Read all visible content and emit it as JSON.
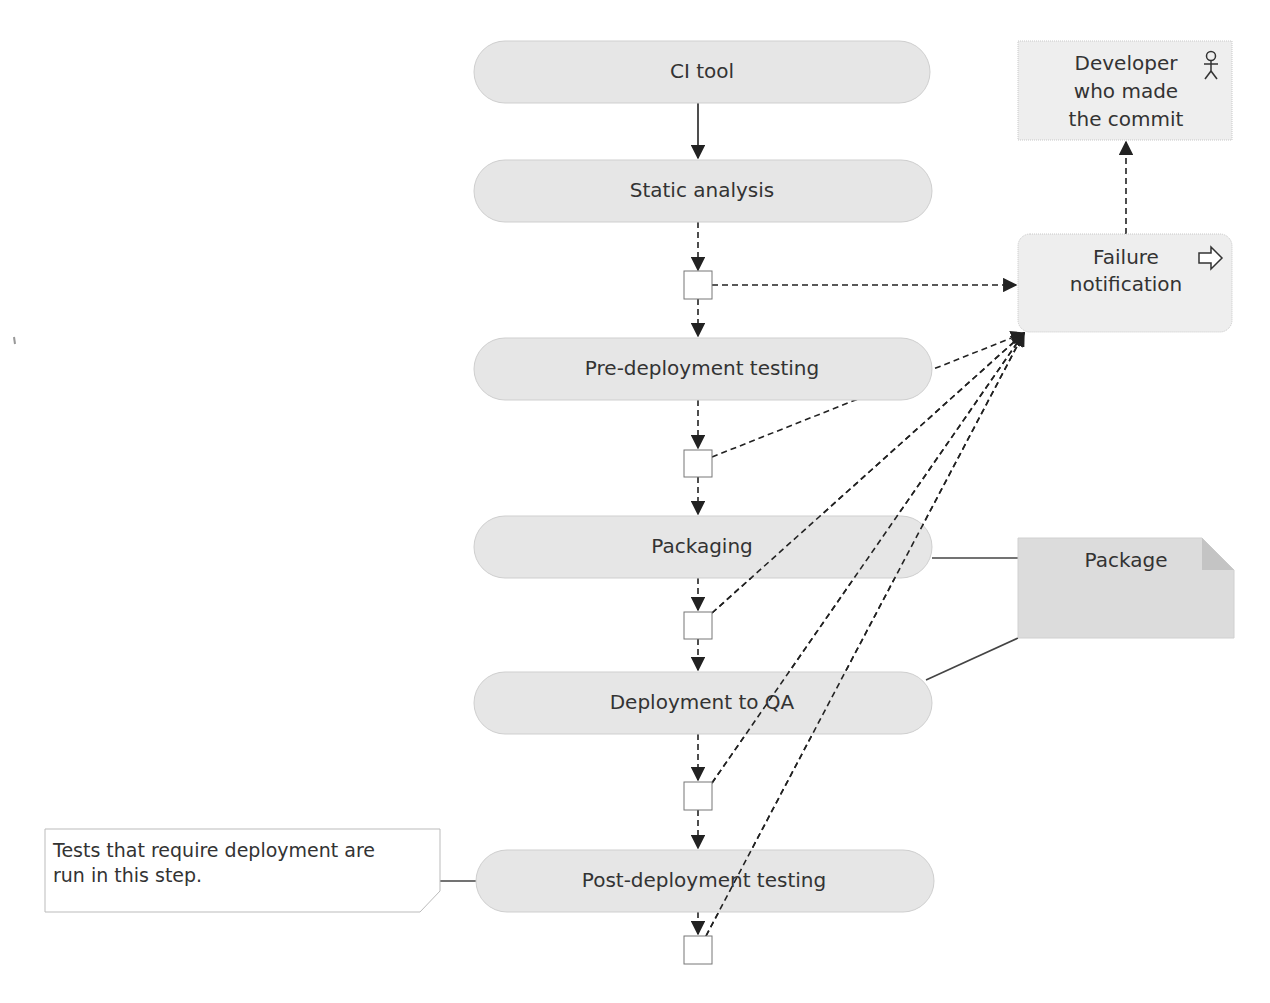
{
  "diagram": {
    "type": "activity-flow",
    "colors": {
      "node_fill": "#e6e6e6",
      "node_border": "#c8c8c8",
      "text": "#333333",
      "edge": "#222222",
      "package_fill": "#dcdcdc",
      "package_fold": "#c4c4c4",
      "comment_fill": "#ffffff"
    },
    "steps": [
      {
        "id": "ci-tool",
        "label": "CI tool"
      },
      {
        "id": "static-analysis",
        "label": "Static analysis"
      },
      {
        "id": "pre-deployment-testing",
        "label": "Pre-deployment testing"
      },
      {
        "id": "packaging",
        "label": "Packaging"
      },
      {
        "id": "deployment-to-qa",
        "label": "Deployment to QA"
      },
      {
        "id": "post-deployment-testing",
        "label": "Post-deployment testing"
      }
    ],
    "decisions": [
      {
        "after": "static-analysis"
      },
      {
        "after": "pre-deployment-testing"
      },
      {
        "after": "packaging"
      },
      {
        "after": "deployment-to-qa"
      },
      {
        "after": "post-deployment-testing"
      }
    ],
    "failure_notification": {
      "label_line1": "Failure",
      "label_line2": "notification",
      "icon": "send-signal-arrow-icon"
    },
    "developer": {
      "label_line1": "Developer",
      "label_line2": "who made",
      "label_line3": "the commit",
      "icon": "actor-stick-figure-icon"
    },
    "artifact": {
      "label": "Package",
      "connected_to": [
        "packaging",
        "deployment-to-qa"
      ]
    },
    "comment": {
      "line1": "Tests that require deployment are",
      "line2": "run in this step.",
      "attached_to": "post-deployment-testing"
    },
    "edges": [
      {
        "from": "ci-tool",
        "to": "static-analysis",
        "style": "solid"
      },
      {
        "from": "static-analysis",
        "to": "decision-1",
        "style": "dashed"
      },
      {
        "from": "decision-1",
        "to": "pre-deployment-testing",
        "style": "dashed"
      },
      {
        "from": "decision-1",
        "to": "failure-notification",
        "style": "dashed"
      },
      {
        "from": "pre-deployment-testing",
        "to": "decision-2",
        "style": "dashed"
      },
      {
        "from": "decision-2",
        "to": "packaging",
        "style": "dashed"
      },
      {
        "from": "decision-2",
        "to": "failure-notification",
        "style": "dashed"
      },
      {
        "from": "packaging",
        "to": "decision-3",
        "style": "dashed"
      },
      {
        "from": "decision-3",
        "to": "deployment-to-qa",
        "style": "dashed"
      },
      {
        "from": "decision-3",
        "to": "failure-notification",
        "style": "dashed"
      },
      {
        "from": "deployment-to-qa",
        "to": "decision-4",
        "style": "dashed"
      },
      {
        "from": "decision-4",
        "to": "post-deployment-testing",
        "style": "dashed"
      },
      {
        "from": "decision-4",
        "to": "failure-notification",
        "style": "dashed"
      },
      {
        "from": "post-deployment-testing",
        "to": "decision-5",
        "style": "dashed"
      },
      {
        "from": "decision-5",
        "to": "failure-notification",
        "style": "dashed"
      },
      {
        "from": "failure-notification",
        "to": "developer",
        "style": "dashed"
      }
    ]
  }
}
